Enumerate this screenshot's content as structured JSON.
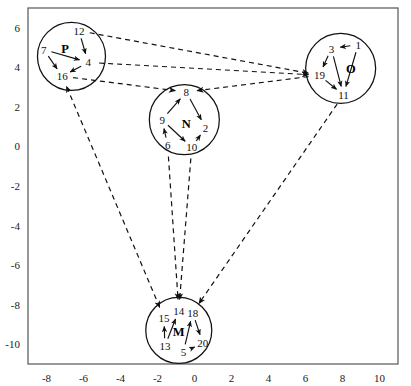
{
  "figure": {
    "type": "node-link-diagram",
    "frame": {
      "left": 28,
      "top": 8,
      "right": 398,
      "bottom": 364
    },
    "background_color": "#ffffff",
    "line_color": "#111111"
  },
  "axes": {
    "x": {
      "tick_labels": [
        "-8",
        "-6",
        "-4",
        "-2",
        "0",
        "2",
        "4",
        "6",
        "8",
        "10"
      ],
      "tick_values": [
        -8,
        -6,
        -4,
        -2,
        0,
        2,
        4,
        6,
        8,
        10
      ],
      "min": -9,
      "max": 11
    },
    "y": {
      "tick_labels": [
        "6",
        "4",
        "2",
        "0",
        "-2",
        "-4",
        "-6",
        "-8",
        "-10"
      ],
      "tick_values": [
        6,
        4,
        2,
        0,
        -2,
        -4,
        -6,
        -8,
        -10
      ],
      "min": -11,
      "max": 7
    }
  },
  "clusters": [
    {
      "id": "P",
      "label": "P",
      "label_x": -7.0,
      "label_y": 4.95,
      "center_x": -6.65,
      "center_y": 4.55,
      "radius_px": 34,
      "nodes": [
        {
          "id": "7",
          "label": "7",
          "x": -8.15,
          "y": 4.9
        },
        {
          "id": "12",
          "label": "12",
          "x": -6.25,
          "y": 5.85
        },
        {
          "id": "4",
          "label": "4",
          "x": -5.75,
          "y": 4.25
        },
        {
          "id": "16",
          "label": "16",
          "x": -7.15,
          "y": 3.55
        }
      ],
      "edges": [
        {
          "from": "12",
          "to": "4"
        },
        {
          "from": "7",
          "to": "4"
        },
        {
          "from": "7",
          "to": "16"
        },
        {
          "from": "4",
          "to": "16"
        }
      ]
    },
    {
      "id": "N",
      "label": "N",
      "label_x": -0.45,
      "label_y": 1.15,
      "center_x": -0.55,
      "center_y": 1.35,
      "radius_px": 35,
      "nodes": [
        {
          "id": "8",
          "label": "8",
          "x": -0.45,
          "y": 2.75
        },
        {
          "id": "9",
          "label": "9",
          "x": -1.75,
          "y": 1.35
        },
        {
          "id": "2",
          "label": "2",
          "x": 0.6,
          "y": 0.95
        },
        {
          "id": "6",
          "label": "6",
          "x": -1.45,
          "y": 0.05
        },
        {
          "id": "10",
          "label": "10",
          "x": -0.15,
          "y": -0.05
        }
      ],
      "edges": [
        {
          "from": "9",
          "to": "8"
        },
        {
          "from": "8",
          "to": "2"
        },
        {
          "from": "6",
          "to": "9"
        },
        {
          "from": "9",
          "to": "10"
        },
        {
          "from": "10",
          "to": "2"
        }
      ]
    },
    {
      "id": "O",
      "label": "O",
      "label_x": 8.45,
      "label_y": 3.9,
      "center_x": 7.9,
      "center_y": 3.95,
      "radius_px": 35,
      "nodes": [
        {
          "id": "1",
          "label": "1",
          "x": 8.85,
          "y": 5.15
        },
        {
          "id": "3",
          "label": "3",
          "x": 7.4,
          "y": 4.95
        },
        {
          "id": "19",
          "label": "19",
          "x": 6.75,
          "y": 3.6
        },
        {
          "id": "11",
          "label": "11",
          "x": 8.05,
          "y": 2.6
        }
      ],
      "edges": [
        {
          "from": "1",
          "to": "3"
        },
        {
          "from": "3",
          "to": "19"
        },
        {
          "from": "3",
          "to": "11"
        },
        {
          "from": "1",
          "to": "11"
        },
        {
          "from": "19",
          "to": "11"
        }
      ]
    },
    {
      "id": "M",
      "label": "M",
      "label_x": -0.85,
      "label_y": -9.4,
      "center_x": -0.85,
      "center_y": -9.3,
      "radius_px": 33,
      "nodes": [
        {
          "id": "15",
          "label": "15",
          "x": -1.65,
          "y": -8.65
        },
        {
          "id": "14",
          "label": "14",
          "x": -0.85,
          "y": -8.3
        },
        {
          "id": "18",
          "label": "18",
          "x": -0.1,
          "y": -8.4
        },
        {
          "id": "13",
          "label": "13",
          "x": -1.6,
          "y": -10.1
        },
        {
          "id": "5",
          "label": "5",
          "x": -0.6,
          "y": -10.4
        },
        {
          "id": "20",
          "label": "20",
          "x": 0.45,
          "y": -9.95
        }
      ],
      "edges": [
        {
          "from": "13",
          "to": "15"
        },
        {
          "from": "13",
          "to": "14"
        },
        {
          "from": "5",
          "to": "18"
        },
        {
          "from": "18",
          "to": "20"
        },
        {
          "from": "5",
          "to": "20"
        }
      ]
    }
  ],
  "inter_cluster_edges": [
    {
      "from_cluster": "P",
      "from_node": "12",
      "to_cluster": "O",
      "to_node": "19",
      "style": "dashed",
      "direction": "forward"
    },
    {
      "from_cluster": "P",
      "from_node": "4",
      "to_cluster": "O",
      "to_node": "19",
      "style": "dashed",
      "direction": "forward"
    },
    {
      "from_cluster": "P",
      "from_node": "16",
      "to_cluster": "N",
      "to_node": "8",
      "style": "dashed",
      "direction": "forward"
    },
    {
      "from_cluster": "O",
      "from_node": "19",
      "to_cluster": "N",
      "to_node": "8",
      "style": "dashed",
      "direction": "forward"
    },
    {
      "from_cluster": "M",
      "from_node": "15",
      "to_cluster": "P",
      "to_node": "16",
      "style": "dashed",
      "direction": "both"
    },
    {
      "from_cluster": "N",
      "from_node": "6",
      "to_cluster": "M",
      "to_node": "14",
      "style": "dashed",
      "direction": "forward"
    },
    {
      "from_cluster": "N",
      "from_node": "10",
      "to_cluster": "M",
      "to_node": "14",
      "style": "dashed",
      "direction": "forward"
    },
    {
      "from_cluster": "O",
      "from_node": "11",
      "to_cluster": "M",
      "to_node": "18",
      "style": "dashed",
      "direction": "forward"
    }
  ]
}
